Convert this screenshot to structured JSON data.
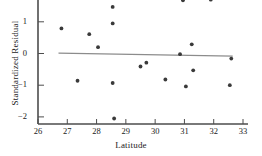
{
  "chart_data": {
    "type": "scatter",
    "title": "",
    "xlabel": "Latitude",
    "ylabel": "Standardized Residual",
    "xlim": [
      26,
      33
    ],
    "ylim": [
      -2.2,
      1.75
    ],
    "xticks": [
      26,
      27,
      28,
      29,
      30,
      31,
      32,
      33
    ],
    "yticks": [
      1,
      0,
      -1,
      -2
    ],
    "xtick_labels": [
      "26",
      "27",
      "28",
      "29",
      "30",
      "31",
      "32",
      "33"
    ],
    "ytick_labels": [
      "1",
      "0",
      "−1",
      "−2"
    ],
    "grid": false,
    "legend": null,
    "x": [
      26.8,
      27.35,
      27.75,
      28.05,
      28.55,
      28.55,
      28.55,
      28.6,
      29.5,
      29.7,
      30.35,
      30.85,
      30.95,
      31.05,
      31.25,
      31.3,
      31.9,
      32.55,
      32.6
    ],
    "y": [
      0.79,
      -0.86,
      0.61,
      0.2,
      1.47,
      0.95,
      -0.93,
      -2.05,
      -0.41,
      -0.29,
      -0.82,
      -0.02,
      1.68,
      -1.04,
      0.29,
      -0.53,
      1.7,
      -1.0,
      -0.16
    ],
    "points": [
      {
        "x": 26.8,
        "y": 0.79
      },
      {
        "x": 27.35,
        "y": -0.86
      },
      {
        "x": 27.75,
        "y": 0.61
      },
      {
        "x": 28.05,
        "y": 0.2
      },
      {
        "x": 28.55,
        "y": 1.47
      },
      {
        "x": 28.55,
        "y": 0.95
      },
      {
        "x": 28.55,
        "y": -0.93
      },
      {
        "x": 28.6,
        "y": -2.05
      },
      {
        "x": 29.5,
        "y": -0.41
      },
      {
        "x": 29.7,
        "y": -0.29
      },
      {
        "x": 30.35,
        "y": -0.82
      },
      {
        "x": 30.85,
        "y": -0.02
      },
      {
        "x": 30.95,
        "y": 1.68
      },
      {
        "x": 31.05,
        "y": -1.04
      },
      {
        "x": 31.25,
        "y": 0.29
      },
      {
        "x": 31.3,
        "y": -0.53
      },
      {
        "x": 31.9,
        "y": 1.7
      },
      {
        "x": 32.55,
        "y": -1.0
      },
      {
        "x": 32.6,
        "y": -0.16
      }
    ],
    "reference_line": {
      "name": "zero-residual-fit-line",
      "x_start": 26.7,
      "y_start": 0.01,
      "x_end": 32.65,
      "y_end": -0.08
    },
    "marker_color": "#3a3a3a",
    "line_color": "#8c8c8c",
    "axis_color": "#4d4d4d",
    "background_color": "#ffffff"
  }
}
